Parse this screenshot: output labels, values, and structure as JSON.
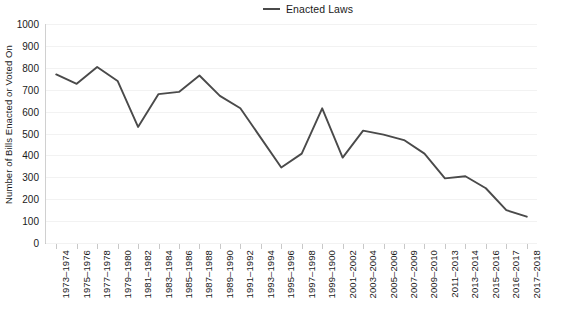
{
  "legend": {
    "series_label": "Enacted Laws",
    "position": "top-center",
    "swatch_name": "line-swatch"
  },
  "axes": {
    "ylabel": "Number of Bills Enacted or Voted On",
    "xlabel": "",
    "ytick_labels": [
      "0",
      "100",
      "200",
      "300",
      "400",
      "500",
      "600",
      "700",
      "800",
      "900",
      "1000"
    ]
  },
  "chart_data": {
    "type": "line",
    "title": "",
    "subtitle": "",
    "xlabel": "",
    "ylabel": "Number of Bills Enacted or Voted On",
    "ylim": [
      0,
      1000
    ],
    "ytick_step": 100,
    "grid": true,
    "legend_position": "top-center",
    "line_color": "#4a4a4a",
    "categories": [
      "1973–1974",
      "1975–1976",
      "1977–1978",
      "1979–1980",
      "1981–1982",
      "1983–1984",
      "1985–1986",
      "1987–1988",
      "1989–1990",
      "1991–1992",
      "1993–1994",
      "1995–1996",
      "1997–1998",
      "1999–1900",
      "2001–2002",
      "2003–2004",
      "2005–2006",
      "2007–2009",
      "2009–2010",
      "2011–2013",
      "2013–2014",
      "2015–2016",
      "2016–2017",
      "2017–2018"
    ],
    "series": [
      {
        "name": "Enacted Laws",
        "values": [
          770,
          727,
          804,
          740,
          530,
          680,
          690,
          765,
          672,
          615,
          480,
          345,
          408,
          615,
          390,
          513,
          495,
          470,
          408,
          295,
          305,
          250,
          150,
          120
        ]
      }
    ]
  }
}
